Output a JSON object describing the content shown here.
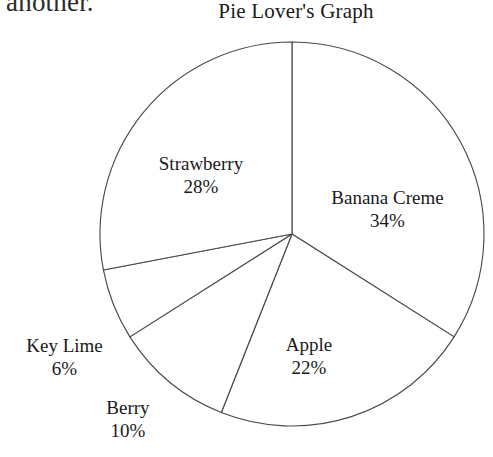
{
  "page": {
    "background_color": "#ffffff",
    "carryover_text": "another.",
    "ink_color": "#1a1a1a",
    "stroke_color": "#4a4a4a"
  },
  "chart_data": {
    "type": "pie",
    "title": "Pie Lover's Graph",
    "xlabel": "",
    "ylabel": "",
    "units": "percent",
    "total": 100,
    "start_angle_deg": 0,
    "direction": "clockwise",
    "legend": "none",
    "grid": false,
    "labels_position": "inside-and-outside",
    "categories": [
      "Banana Creme",
      "Apple",
      "Berry",
      "Key Lime",
      "Strawberry"
    ],
    "values": [
      34,
      22,
      10,
      6,
      28
    ],
    "slices": [
      {
        "name": "Banana Creme",
        "label": "Banana Creme",
        "value": 34,
        "value_text": "34%",
        "start_deg": 0,
        "end_deg": 122.4,
        "fill": "#ffffff",
        "label_placement": "inside-right"
      },
      {
        "name": "Apple",
        "label": "Apple",
        "value": 22,
        "value_text": "22%",
        "start_deg": 122.4,
        "end_deg": 201.6,
        "fill": "#ffffff",
        "label_placement": "inside-bottom"
      },
      {
        "name": "Berry",
        "label": "Berry",
        "value": 10,
        "value_text": "10%",
        "start_deg": 201.6,
        "end_deg": 237.6,
        "fill": "#ffffff",
        "label_placement": "outside-bottom-left"
      },
      {
        "name": "Key Lime",
        "label": "Key Lime",
        "value": 6,
        "value_text": "6%",
        "start_deg": 237.6,
        "end_deg": 259.2,
        "fill": "#ffffff",
        "label_placement": "outside-left"
      },
      {
        "name": "Strawberry",
        "label": "Strawberry",
        "value": 28,
        "value_text": "28%",
        "start_deg": 259.2,
        "end_deg": 360,
        "fill": "#ffffff",
        "label_placement": "inside-upper-left"
      }
    ],
    "geometry": {
      "center_x": 292,
      "center_y": 234,
      "radius": 192
    }
  }
}
